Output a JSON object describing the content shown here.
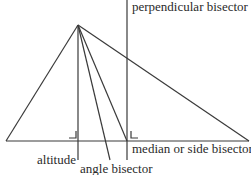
{
  "diagram": {
    "labels": {
      "perpendicular_bisector": "perpendicular bisector",
      "median": "median or side bisector",
      "altitude": "altitude",
      "angle_bisector": "angle bisector"
    },
    "geometry": {
      "apex": [
        78,
        25
      ],
      "base_left": [
        6,
        141
      ],
      "base_right": [
        249,
        141
      ],
      "altitude_foot": [
        78,
        141
      ],
      "angle_bisector_end": [
        110,
        160
      ],
      "median_foot": [
        127,
        141
      ],
      "perpendicular_bisector_x": 127
    },
    "colors": {
      "line": "#3a3a3a",
      "text": "#2a2a2a",
      "background": "#ffffff"
    }
  }
}
